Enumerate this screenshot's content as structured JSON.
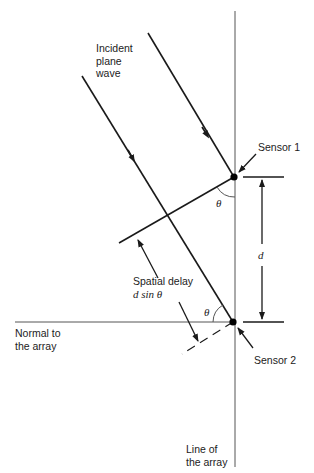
{
  "labels": {
    "incident_line1": "Incident",
    "incident_line2": "plane",
    "incident_line3": "wave",
    "sensor1": "Sensor 1",
    "sensor2": "Sensor 2",
    "spacing": "d",
    "theta_top": "θ",
    "theta_bottom": "θ",
    "delay_line1": "Spatial delay",
    "delay_line2": "d sin θ",
    "normal_line1": "Normal to",
    "normal_line2": "the array",
    "array_line1": "Line of",
    "array_line2": "the array"
  },
  "colors": {
    "line": "#1a1a1a",
    "axis": "#555555",
    "background": "#ffffff"
  }
}
